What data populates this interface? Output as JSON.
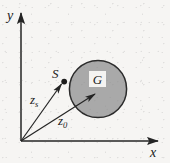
{
  "figure": {
    "type": "technical-diagram",
    "background_color": "#f6f5f3",
    "stroke_color": "#262626",
    "region_fill_color": "#a9a9a9",
    "axes": {
      "origin": {
        "x": 21,
        "y": 141
      },
      "x_axis": {
        "label": "x",
        "tip": {
          "x": 161,
          "y": 141
        }
      },
      "y_axis": {
        "label": "y",
        "tip": {
          "x": 21,
          "y": 10
        }
      }
    },
    "region": {
      "label": "G",
      "center": {
        "x": 98,
        "y": 89
      },
      "radius": 29
    },
    "point_s": {
      "label": "S",
      "position": {
        "x": 64,
        "y": 82
      }
    },
    "vectors": [
      {
        "name": "z_s",
        "base_label": "z",
        "subscript": "s",
        "from": {
          "x": 21,
          "y": 141
        },
        "to": {
          "x": 63,
          "y": 82
        }
      },
      {
        "name": "z_0",
        "base_label": "z",
        "subscript": "0",
        "from": {
          "x": 21,
          "y": 141
        },
        "to": {
          "x": 97,
          "y": 93
        }
      }
    ]
  }
}
